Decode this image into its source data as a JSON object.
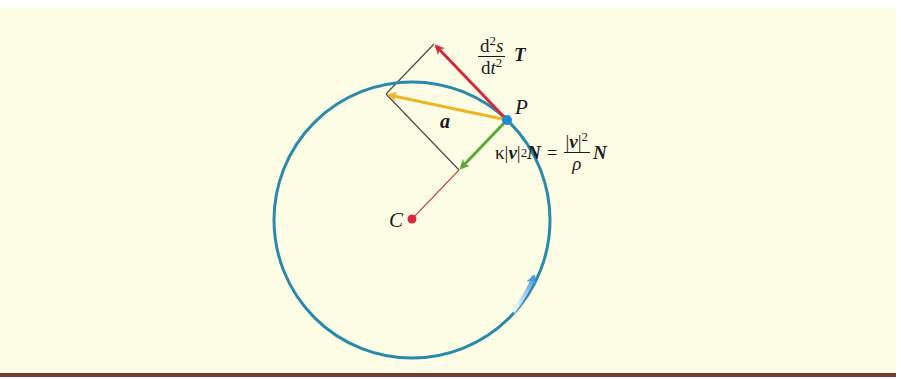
{
  "figure": {
    "background_color": "#fefde6",
    "border_color": "#7a3b2e",
    "circle": {
      "center": [
        412,
        220
      ],
      "radius": 138,
      "color": "#2a8aaa",
      "direction_arrow_color": "#5aaee6"
    },
    "points": {
      "P": {
        "label": "P",
        "xy": [
          507,
          120
        ],
        "color": "#1e88d8"
      },
      "C": {
        "label": "C",
        "xy": [
          412,
          219
        ],
        "color": "#d8283c"
      }
    },
    "vectors": [
      {
        "name": "tangential",
        "from": [
          507,
          120
        ],
        "to": [
          434,
          44
        ],
        "color": "#d8283c"
      },
      {
        "name": "acceleration",
        "from": [
          507,
          120
        ],
        "to": [
          386,
          94
        ],
        "color": "#f0b428",
        "label": "a"
      },
      {
        "name": "normal",
        "from": [
          507,
          120
        ],
        "to": [
          459,
          170
        ],
        "color": "#5aa83a"
      }
    ],
    "construction_lines": {
      "color": "#4a4a4a",
      "radius_line_color": "#c8504a"
    },
    "labels": {
      "tangential": {
        "num_d": "d",
        "num_exp": "2",
        "num_s": "s",
        "den_d": "d",
        "den_t": "t",
        "den_exp": "2",
        "vector": "T"
      },
      "acceleration": "a",
      "point_P": "P",
      "point_C": "C",
      "normal": {
        "kappa": "κ",
        "abs_open": "|",
        "v": "v",
        "abs_close": "|",
        "exp": "2",
        "N": "N",
        "equals": "=",
        "frac_num_open": "|",
        "frac_num_v": "v",
        "frac_num_close": "|",
        "frac_num_exp": "2",
        "frac_den": "ρ",
        "N2": "N"
      }
    }
  }
}
